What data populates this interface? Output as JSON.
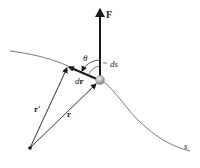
{
  "diagram": {
    "type": "physics-vector-diagram",
    "labels": {
      "force": "F",
      "angle": "θ",
      "arc_length": "ds",
      "displacement_d": "d",
      "displacement_r": "r",
      "position_prime": "r'",
      "position": "r",
      "path": "s"
    },
    "colors": {
      "line": "#1a1a1a",
      "curve": "#6a6a6a",
      "particle_light": "#e0e0e0",
      "particle_dark": "#8a8a8a"
    }
  }
}
